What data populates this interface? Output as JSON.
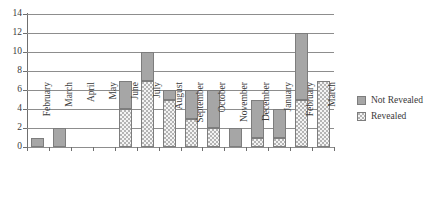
{
  "chart_data": {
    "type": "bar",
    "subtype": "stacked-vertical-bar",
    "title": "",
    "xlabel": "",
    "ylabel": "",
    "ylim": [
      0,
      14
    ],
    "ytick_step": 2,
    "ytick_labels": [
      "0",
      "2",
      "4",
      "6",
      "8",
      "10",
      "12",
      "14"
    ],
    "grid": true,
    "legend_position": "right",
    "categories": [
      "February",
      "March",
      "April",
      "May",
      "June",
      "July",
      "August",
      "September",
      "October",
      "November",
      "December",
      "January",
      "February",
      "March"
    ],
    "series": [
      {
        "name": "Revealed",
        "color": "#b4b4b4",
        "pattern": "cross-hatch",
        "values": [
          0,
          0,
          0,
          0,
          4,
          7,
          5,
          3,
          2,
          0,
          1,
          1,
          5,
          7
        ]
      },
      {
        "name": "Not Revealed",
        "color": "#a6a6a6",
        "pattern": "solid",
        "values": [
          1,
          2,
          0,
          0,
          3,
          3,
          1,
          3,
          4,
          2,
          4,
          3,
          7,
          0
        ]
      }
    ],
    "totals": [
      1,
      2,
      0,
      0,
      7,
      10,
      6,
      6,
      6,
      2,
      5,
      4,
      12,
      7
    ]
  },
  "legend": {
    "items": [
      {
        "label": "Not Revealed",
        "swatch": "solid-gray-swatch"
      },
      {
        "label": "Revealed",
        "swatch": "cross-hatch-swatch"
      }
    ]
  }
}
